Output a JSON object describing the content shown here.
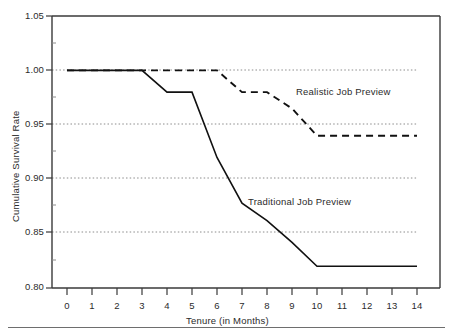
{
  "chart_data": {
    "type": "line",
    "title": "",
    "subtitle": "",
    "xlabel": "Tenure (in Months)",
    "ylabel": "Cumulative Survival Rate",
    "xlim": [
      0,
      14
    ],
    "ylim": [
      0.8,
      1.05
    ],
    "grid": true,
    "grid_axis": "y",
    "gridlines_y": [
      1.0,
      0.95,
      0.9,
      0.85
    ],
    "legend_position": "inline-annotation",
    "xticks": [
      0,
      1,
      2,
      3,
      4,
      5,
      6,
      7,
      8,
      9,
      10,
      11,
      12,
      13,
      14
    ],
    "xtick_labels": [
      "0",
      "1",
      "2",
      "3",
      "4",
      "5",
      "6",
      "7",
      "8",
      "9",
      "10",
      "11",
      "12",
      "13",
      "14"
    ],
    "yticks": [
      0.8,
      0.85,
      0.9,
      0.95,
      1.0,
      1.05
    ],
    "ytick_labels": [
      "0.80",
      "0.85",
      "0.90",
      "0.95",
      "1.00",
      "1.05"
    ],
    "x": [
      0,
      1,
      2,
      3,
      4,
      5,
      6,
      7,
      8,
      9,
      10,
      11,
      12,
      13,
      14
    ],
    "series": [
      {
        "name": "Realistic Job Preview",
        "style": "dashed",
        "color": "#111111",
        "values": [
          1.0,
          1.0,
          1.0,
          1.0,
          1.0,
          1.0,
          1.0,
          0.98,
          0.98,
          0.965,
          0.94,
          0.94,
          0.94,
          0.94,
          0.94
        ],
        "annotation": "Realistic Job Preview"
      },
      {
        "name": "Traditional Job Preview",
        "style": "solid",
        "color": "#111111",
        "values": [
          1.0,
          1.0,
          1.0,
          1.0,
          0.98,
          0.98,
          0.92,
          0.878,
          0.862,
          0.842,
          0.82,
          0.82,
          0.82,
          0.82,
          0.82
        ],
        "annotation": "Traditional Job Preview"
      }
    ]
  },
  "annotations": {
    "realistic": "Realistic Job Preview",
    "traditional": "Traditional Job Preview"
  },
  "axes": {
    "x_title": "Tenure (in Months)",
    "y_title": "Cumulative Survival Rate",
    "x_tick_0": "0",
    "x_tick_1": "1",
    "x_tick_2": "2",
    "x_tick_3": "3",
    "x_tick_4": "4",
    "x_tick_5": "5",
    "x_tick_6": "6",
    "x_tick_7": "7",
    "x_tick_8": "8",
    "x_tick_9": "9",
    "x_tick_10": "10",
    "x_tick_11": "11",
    "x_tick_12": "12",
    "x_tick_13": "13",
    "x_tick_14": "14",
    "y_tick_105": "1.05",
    "y_tick_100": "1.00",
    "y_tick_095": "0.95",
    "y_tick_090": "0.90",
    "y_tick_085": "0.85",
    "y_tick_080": "0.80"
  },
  "colors": {
    "line": "#111111",
    "frame": "#3a3a3a",
    "grid": "#8c8c8c",
    "text": "#2b2b2b",
    "rule": "#6e6e6e",
    "background": "#ffffff"
  }
}
